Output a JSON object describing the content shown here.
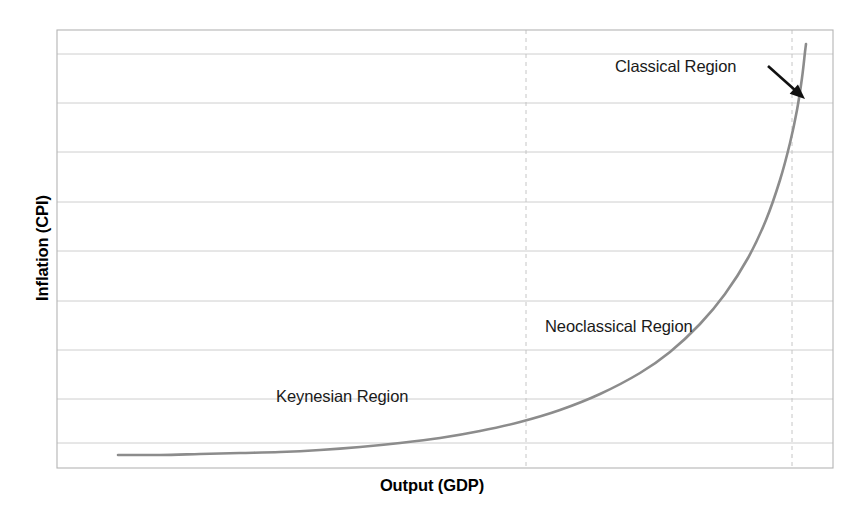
{
  "figure": {
    "width": 864,
    "height": 523,
    "background_color": "#ffffff"
  },
  "axes": {
    "x_title": "Output (GDP)",
    "y_title": "Inflation (CPI)",
    "frame_color": "#b4b4b4",
    "gridline_color": "#c8c8c8",
    "dashed_line_color": "#c0c0c0",
    "plot_left": 57,
    "plot_right": 833,
    "plot_top": 30,
    "plot_bottom": 468,
    "x_tick_labels": [],
    "y_tick_labels": []
  },
  "annotations": [
    {
      "name": "classical-region-label",
      "text": "Classical Region",
      "x": 615,
      "y": 58,
      "has_arrow": true,
      "arrow_from_x": 768,
      "arrow_from_y": 66,
      "arrow_to_x": 805,
      "arrow_to_y": 99,
      "color": "#1a1a1a"
    },
    {
      "name": "neoclassical-region-label",
      "text": "Neoclassical Region",
      "x": 545,
      "y": 318,
      "has_arrow": false,
      "color": "#1a1a1a"
    },
    {
      "name": "keynesian-region-label",
      "text": "Keynesian Region",
      "x": 276,
      "y": 388,
      "has_arrow": false,
      "color": "#1a1a1a"
    }
  ],
  "chart_data": {
    "type": "line",
    "title": "",
    "subtitle": "",
    "xlabel": "Output (GDP)",
    "ylabel": "Inflation (CPI)",
    "xlim": [
      57,
      833
    ],
    "ylim": [
      468,
      30
    ],
    "grid": true,
    "legend_position": "none",
    "series": [
      {
        "name": "Aggregate Supply Curve",
        "color": "#8c8c8c",
        "line_width": 2.6,
        "points_px": [
          [
            118,
            455
          ],
          [
            160,
            455
          ],
          [
            200,
            454
          ],
          [
            240,
            453
          ],
          [
            280,
            452
          ],
          [
            320,
            450
          ],
          [
            360,
            447
          ],
          [
            400,
            443
          ],
          [
            440,
            438
          ],
          [
            480,
            431
          ],
          [
            520,
            422
          ],
          [
            560,
            410
          ],
          [
            600,
            394
          ],
          [
            640,
            373
          ],
          [
            670,
            352
          ],
          [
            700,
            324
          ],
          [
            725,
            294
          ],
          [
            748,
            258
          ],
          [
            766,
            220
          ],
          [
            780,
            180
          ],
          [
            790,
            143
          ],
          [
            797,
            110
          ],
          [
            802,
            78
          ],
          [
            805,
            52
          ],
          [
            806,
            44
          ]
        ]
      }
    ],
    "horizontal_gridlines_px": [
      30,
      54,
      103,
      152,
      202,
      251,
      301,
      350,
      399,
      443,
      468
    ],
    "vertical_dashed_gridlines_px": [
      526,
      792
    ],
    "region_boundaries": {
      "keynesian_to_neoclassical_px": 526,
      "neoclassical_to_classical_px": 792
    },
    "regions": [
      "Keynesian Region",
      "Neoclassical Region",
      "Classical Region"
    ]
  }
}
